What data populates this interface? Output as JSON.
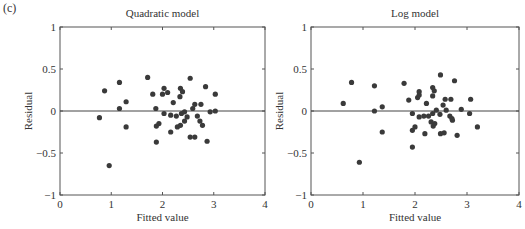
{
  "figure": {
    "panel_label": "(c)"
  },
  "chart_data": [
    {
      "type": "scatter",
      "title": "Quadratic model",
      "xlabel": "Fitted value",
      "ylabel": "Residual",
      "xlim": [
        0,
        4
      ],
      "ylim": [
        -1,
        1
      ],
      "xticks": [
        0,
        1,
        2,
        3,
        4
      ],
      "yticks": [
        -1,
        -0.5,
        0,
        0.5,
        1
      ],
      "ytick_labels": [
        "−1",
        "−0.5",
        "0",
        "0.5",
        "1"
      ],
      "xtick_labels": [
        "0",
        "1",
        "2",
        "3",
        "4"
      ],
      "grid": false,
      "reference_line_y": 0,
      "marker_color": "#3a3a3a",
      "points": [
        [
          0.77,
          -0.08
        ],
        [
          0.87,
          0.24
        ],
        [
          0.96,
          -0.65
        ],
        [
          1.16,
          0.34
        ],
        [
          1.16,
          0.03
        ],
        [
          1.29,
          0.11
        ],
        [
          1.29,
          -0.19
        ],
        [
          1.71,
          0.4
        ],
        [
          1.81,
          0.2
        ],
        [
          1.87,
          0.03
        ],
        [
          1.88,
          -0.18
        ],
        [
          1.88,
          -0.37
        ],
        [
          1.93,
          -0.15
        ],
        [
          2.0,
          0.2
        ],
        [
          2.03,
          0.27
        ],
        [
          2.03,
          -0.03
        ],
        [
          2.1,
          0.22
        ],
        [
          2.16,
          -0.05
        ],
        [
          2.16,
          -0.25
        ],
        [
          2.21,
          0.1
        ],
        [
          2.27,
          -0.06
        ],
        [
          2.29,
          -0.19
        ],
        [
          2.34,
          0.17
        ],
        [
          2.35,
          0.27
        ],
        [
          2.35,
          -0.17
        ],
        [
          2.37,
          -0.03
        ],
        [
          2.39,
          0.23
        ],
        [
          2.43,
          -0.01
        ],
        [
          2.43,
          -0.12
        ],
        [
          2.48,
          -0.07
        ],
        [
          2.54,
          0.39
        ],
        [
          2.54,
          -0.31
        ],
        [
          2.59,
          0.03
        ],
        [
          2.63,
          0.08
        ],
        [
          2.63,
          -0.31
        ],
        [
          2.68,
          -0.06
        ],
        [
          2.73,
          -0.12
        ],
        [
          2.75,
          0.08
        ],
        [
          2.78,
          -0.17
        ],
        [
          2.84,
          0.29
        ],
        [
          2.87,
          -0.36
        ],
        [
          2.93,
          -0.01
        ],
        [
          3.03,
          0.2
        ],
        [
          3.03,
          0.0
        ]
      ]
    },
    {
      "type": "scatter",
      "title": "Log model",
      "xlabel": "Fitted value",
      "ylabel": "Residual",
      "xlim": [
        0,
        4
      ],
      "ylim": [
        -1,
        1
      ],
      "xticks": [
        0,
        1,
        2,
        3,
        4
      ],
      "yticks": [
        -1,
        -0.5,
        0,
        0.5,
        1
      ],
      "ytick_labels": [
        "−1",
        "−0.5",
        "0",
        "0.5",
        "1"
      ],
      "xtick_labels": [
        "0",
        "1",
        "2",
        "3",
        "4"
      ],
      "grid": false,
      "reference_line_y": 0,
      "marker_color": "#3a3a3a",
      "points": [
        [
          0.62,
          0.09
        ],
        [
          0.78,
          0.34
        ],
        [
          0.93,
          -0.61
        ],
        [
          1.22,
          0.3
        ],
        [
          1.22,
          0.0
        ],
        [
          1.37,
          0.05
        ],
        [
          1.37,
          -0.25
        ],
        [
          1.79,
          0.33
        ],
        [
          1.88,
          0.13
        ],
        [
          1.95,
          -0.03
        ],
        [
          1.95,
          -0.23
        ],
        [
          1.95,
          -0.43
        ],
        [
          2.0,
          -0.19
        ],
        [
          2.05,
          0.16
        ],
        [
          2.08,
          0.23
        ],
        [
          2.08,
          0.19
        ],
        [
          2.08,
          -0.07
        ],
        [
          2.17,
          -0.06
        ],
        [
          2.19,
          -0.27
        ],
        [
          2.22,
          0.09
        ],
        [
          2.26,
          -0.06
        ],
        [
          2.31,
          -0.13
        ],
        [
          2.34,
          0.28
        ],
        [
          2.34,
          0.18
        ],
        [
          2.34,
          -0.03
        ],
        [
          2.35,
          -0.18
        ],
        [
          2.37,
          0.24
        ],
        [
          2.38,
          -0.15
        ],
        [
          2.41,
          0.01
        ],
        [
          2.48,
          -0.04
        ],
        [
          2.49,
          0.43
        ],
        [
          2.49,
          -0.27
        ],
        [
          2.54,
          0.07
        ],
        [
          2.56,
          -0.26
        ],
        [
          2.58,
          0.14
        ],
        [
          2.6,
          0.01
        ],
        [
          2.67,
          -0.06
        ],
        [
          2.69,
          0.14
        ],
        [
          2.71,
          -0.09
        ],
        [
          2.72,
          -0.11
        ],
        [
          2.76,
          0.36
        ],
        [
          2.81,
          -0.29
        ],
        [
          2.89,
          0.02
        ],
        [
          3.05,
          -0.03
        ],
        [
          3.07,
          0.14
        ],
        [
          3.2,
          -0.19
        ]
      ]
    }
  ]
}
